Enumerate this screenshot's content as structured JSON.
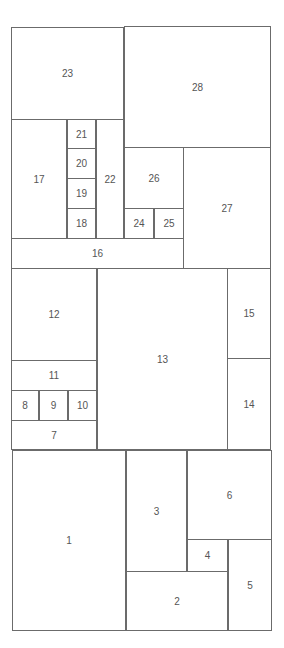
{
  "diagram": {
    "type": "rectangle-partition",
    "line_color": "#6b6b6b",
    "label_color": "#555555",
    "background": "#ffffff",
    "cells": [
      {
        "label": "1",
        "x": 12,
        "y": 450,
        "w": 114,
        "h": 181
      },
      {
        "label": "2",
        "x": 126,
        "y": 571,
        "w": 102,
        "h": 60
      },
      {
        "label": "3",
        "x": 126,
        "y": 450,
        "w": 61,
        "h": 122
      },
      {
        "label": "4",
        "x": 187,
        "y": 539,
        "w": 41,
        "h": 33
      },
      {
        "label": "5",
        "x": 228,
        "y": 539,
        "w": 44,
        "h": 92
      },
      {
        "label": "6",
        "x": 187,
        "y": 450,
        "w": 85,
        "h": 90
      },
      {
        "label": "7",
        "x": 11,
        "y": 420,
        "w": 86,
        "h": 30
      },
      {
        "label": "8",
        "x": 11,
        "y": 390,
        "w": 28,
        "h": 31
      },
      {
        "label": "9",
        "x": 39,
        "y": 390,
        "w": 29,
        "h": 31
      },
      {
        "label": "10",
        "x": 68,
        "y": 390,
        "w": 29,
        "h": 31
      },
      {
        "label": "11",
        "x": 11,
        "y": 360,
        "w": 86,
        "h": 31
      },
      {
        "label": "12",
        "x": 11,
        "y": 268,
        "w": 86,
        "h": 93
      },
      {
        "label": "13",
        "x": 97,
        "y": 268,
        "w": 131,
        "h": 182
      },
      {
        "label": "14",
        "x": 227,
        "y": 358,
        "w": 44,
        "h": 92
      },
      {
        "label": "15",
        "x": 227,
        "y": 268,
        "w": 44,
        "h": 91
      },
      {
        "label": "16",
        "x": 11,
        "y": 238,
        "w": 173,
        "h": 31
      },
      {
        "label": "17",
        "x": 11,
        "y": 119,
        "w": 56,
        "h": 120
      },
      {
        "label": "18",
        "x": 67,
        "y": 208,
        "w": 29,
        "h": 31
      },
      {
        "label": "19",
        "x": 67,
        "y": 178,
        "w": 29,
        "h": 31
      },
      {
        "label": "20",
        "x": 67,
        "y": 148,
        "w": 29,
        "h": 31
      },
      {
        "label": "21",
        "x": 67,
        "y": 119,
        "w": 29,
        "h": 30
      },
      {
        "label": "22",
        "x": 96,
        "y": 119,
        "w": 28,
        "h": 120
      },
      {
        "label": "23",
        "x": 11,
        "y": 27,
        "w": 113,
        "h": 93
      },
      {
        "label": "24",
        "x": 124,
        "y": 208,
        "w": 30,
        "h": 31
      },
      {
        "label": "25",
        "x": 154,
        "y": 208,
        "w": 30,
        "h": 31
      },
      {
        "label": "26",
        "x": 124,
        "y": 147,
        "w": 60,
        "h": 62
      },
      {
        "label": "27",
        "x": 183,
        "y": 147,
        "w": 88,
        "h": 122
      },
      {
        "label": "28",
        "x": 124,
        "y": 26,
        "w": 147,
        "h": 122
      }
    ]
  }
}
